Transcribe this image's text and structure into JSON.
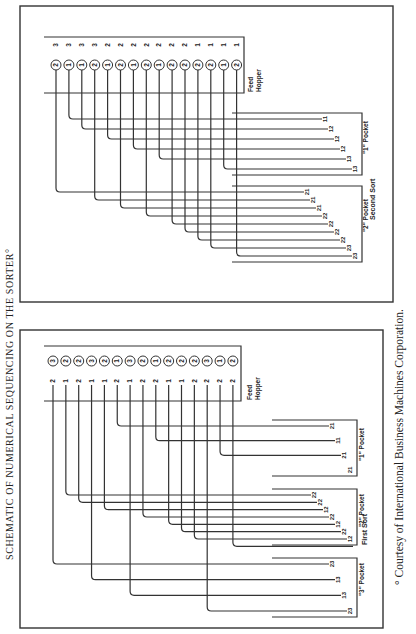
{
  "title": "SCHEMATIC OF NUMERICAL SEQUENCING ON THE SORTER",
  "title_marker": "°",
  "footnote": "° Courtesy of International Business Machines Corporation.",
  "panels": [
    {
      "name": "Second Sort",
      "label": "Second Sort",
      "feed_label_1": "Feed",
      "feed_label_2": "Hopper",
      "cards": [
        {
          "sort_digit": "2",
          "other": "3"
        },
        {
          "sort_digit": "1",
          "other": "3"
        },
        {
          "sort_digit": "1",
          "other": "3"
        },
        {
          "sort_digit": "2",
          "other": "3"
        },
        {
          "sort_digit": "1",
          "other": "2"
        },
        {
          "sort_digit": "2",
          "other": "2"
        },
        {
          "sort_digit": "1",
          "other": "2"
        },
        {
          "sort_digit": "2",
          "other": "2"
        },
        {
          "sort_digit": "1",
          "other": "2"
        },
        {
          "sort_digit": "2",
          "other": "2"
        },
        {
          "sort_digit": "2",
          "other": "2"
        },
        {
          "sort_digit": "2",
          "other": "1"
        },
        {
          "sort_digit": "2",
          "other": "1"
        },
        {
          "sort_digit": "1",
          "other": "1"
        },
        {
          "sort_digit": "2",
          "other": "1"
        }
      ],
      "pockets": [
        {
          "label": "\"1\" Pocket",
          "stack": [
            "11",
            "12",
            "12",
            "12",
            "13",
            "13"
          ]
        },
        {
          "label": "\"2\" Pocket",
          "stack": [
            "21",
            "21",
            "21",
            "22",
            "22",
            "22",
            "22",
            "23",
            "23"
          ]
        }
      ]
    },
    {
      "name": "First Sort",
      "label": "First Sort",
      "feed_label_1": "Feed",
      "feed_label_2": "Hopper",
      "cards": [
        {
          "sort_digit": "3",
          "other": "2"
        },
        {
          "sort_digit": "2",
          "other": "1"
        },
        {
          "sort_digit": "2",
          "other": "2"
        },
        {
          "sort_digit": "3",
          "other": "1"
        },
        {
          "sort_digit": "2",
          "other": "1"
        },
        {
          "sort_digit": "1",
          "other": "2"
        },
        {
          "sort_digit": "3",
          "other": "1"
        },
        {
          "sort_digit": "2",
          "other": "2"
        },
        {
          "sort_digit": "1",
          "other": "2"
        },
        {
          "sort_digit": "2",
          "other": "1"
        },
        {
          "sort_digit": "2",
          "other": "1"
        },
        {
          "sort_digit": "2",
          "other": "2"
        },
        {
          "sort_digit": "3",
          "other": "2"
        },
        {
          "sort_digit": "1",
          "other": "2"
        },
        {
          "sort_digit": "2",
          "other": "2"
        }
      ],
      "pockets": [
        {
          "label": "\"1\" Pocket",
          "stack": [
            "21",
            "11",
            "21",
            "21"
          ]
        },
        {
          "label": "\"2\" Pocket",
          "stack": [
            "22",
            "22",
            "12",
            "22",
            "12",
            "22",
            "12"
          ]
        },
        {
          "label": "\"3\" Pocket",
          "stack": [
            "23",
            "13",
            "13",
            "23"
          ]
        }
      ]
    }
  ]
}
